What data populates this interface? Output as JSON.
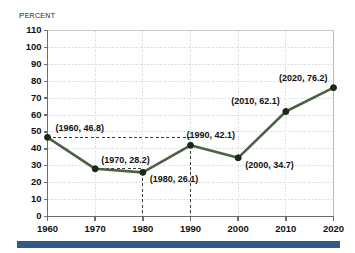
{
  "chart_data": {
    "type": "line",
    "title": "",
    "ylabel": "Percent",
    "xlabel": "",
    "ylim": [
      0,
      110
    ],
    "ytick_step": 10,
    "grid": true,
    "legend": "none",
    "line_color": "#4e6146",
    "marker_color": "#1b2a18",
    "x": [
      1960,
      1970,
      1980,
      1990,
      2000,
      2010,
      2020
    ],
    "values": [
      46.8,
      28.2,
      26.1,
      42.1,
      34.7,
      62.1,
      76.2
    ],
    "categories": [
      "1960",
      "1970",
      "1980",
      "1990",
      "2000",
      "2010",
      "2020"
    ],
    "ytick_labels": [
      "110",
      "100",
      "90",
      "80",
      "70",
      "60",
      "50",
      "40",
      "30",
      "20",
      "10",
      "0"
    ],
    "point_labels": [
      "(1960, 46.8)",
      "(1970, 28.2)",
      "(1980, 26.1)",
      "(1990, 42.1)",
      "(2000, 34.7)",
      "(2010, 62.1)",
      "(2020, 76.2)"
    ],
    "annotations": {
      "dashed_horizontal_from": [
        1960,
        1970
      ],
      "dashed_vertical_from": [
        1980,
        1990
      ]
    }
  },
  "decoration": {
    "bottom_rule_color": "#32598a"
  }
}
